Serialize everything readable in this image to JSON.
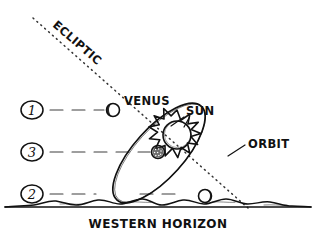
{
  "diagram": {
    "background_color": "#ffffff",
    "ink_color": "#111111",
    "labels": {
      "ecliptic": "ECLIPTIC",
      "venus": "VENUS",
      "sun": "SUN",
      "orbit": "ORBIT",
      "horizon": "WESTERN HORIZON"
    },
    "markers": [
      {
        "id": "marker-1",
        "label": "1",
        "cx": 32,
        "cy": 110,
        "rx": 11,
        "ry": 9
      },
      {
        "id": "marker-3",
        "label": "3",
        "cx": 32,
        "cy": 152,
        "rx": 11,
        "ry": 9
      },
      {
        "id": "marker-2",
        "label": "2",
        "cx": 32,
        "cy": 194,
        "rx": 11,
        "ry": 9
      }
    ],
    "leader_lines": [
      {
        "id": "leader-1",
        "x1": 50,
        "y1": 110,
        "x2": 104,
        "y2": 110
      },
      {
        "id": "leader-3",
        "x1": 50,
        "y1": 152,
        "x2": 150,
        "y2": 152
      },
      {
        "id": "leader-2",
        "x1": 50,
        "y1": 194,
        "x2": 96,
        "y2": 194
      }
    ],
    "planets": [
      {
        "id": "planet-venus",
        "cx": 113,
        "cy": 110,
        "r": 6.5,
        "shading": "left-lit"
      },
      {
        "id": "planet-position-3",
        "cx": 158,
        "cy": 152,
        "r": 6.5,
        "shading": "stippled"
      },
      {
        "id": "planet-position-2",
        "cx": 205,
        "cy": 196,
        "r": 6.5,
        "shading": "right-dark"
      }
    ],
    "sun": {
      "cx": 177,
      "cy": 135,
      "r": 14,
      "spikes": 13,
      "spike_length": 11
    },
    "orbit": {
      "cx": 159,
      "cy": 153,
      "rx": 25,
      "ry": 63,
      "rotation_deg": 42
    },
    "ecliptic": {
      "x1": 33,
      "y1": 18,
      "x2": 248,
      "y2": 208,
      "style": "dotted"
    },
    "horizon": {
      "y": 206,
      "style": "wavy-hills",
      "span": [
        4,
        312
      ]
    }
  }
}
